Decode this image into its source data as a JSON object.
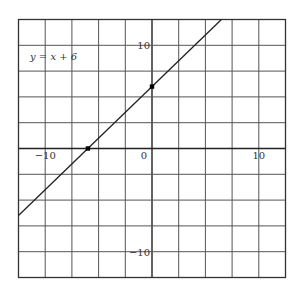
{
  "chart_data": {
    "type": "line",
    "title": "",
    "equation_label": "y = x + 6",
    "xlabel": "",
    "ylabel": "",
    "xlim": [
      -12.5,
      12.5
    ],
    "ylim": [
      -12.5,
      12.5
    ],
    "grid": true,
    "grid_step": 2.5,
    "x_tick_labels": [
      {
        "value": -10,
        "label": "−10"
      },
      {
        "value": 0,
        "label": "0"
      },
      {
        "value": 10,
        "label": "10"
      }
    ],
    "y_tick_labels": [
      {
        "value": 10,
        "label": "10"
      },
      {
        "value": -10,
        "label": "−10"
      }
    ],
    "series": [
      {
        "name": "y = x + 6",
        "slope": 1,
        "intercept": 6,
        "x": [
          -12.5,
          6.5
        ],
        "y": [
          -6.5,
          12.5
        ]
      }
    ],
    "points": [
      {
        "x": -6,
        "y": 0
      },
      {
        "x": 0,
        "y": 6
      }
    ],
    "colors": {
      "grid": "#555555",
      "line": "#222222",
      "point": "#000000"
    }
  }
}
